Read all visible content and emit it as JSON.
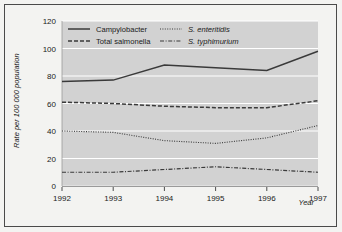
{
  "figure": {
    "background_color": "#f3f3f1",
    "plot_background_color": "#d2d2d2",
    "border_color": "#4a4a4a",
    "gridline_color": "#ffffff",
    "line_color": "#3a3a3a"
  },
  "chart_data": {
    "type": "line",
    "title": "",
    "subtitle": "",
    "xlabel": "Year",
    "ylabel": "Rate per 100 000 population",
    "x": [
      1992,
      1993,
      1994,
      1995,
      1996,
      1997
    ],
    "categories": [
      "1992",
      "1993",
      "1994",
      "1995",
      "1996",
      "1997"
    ],
    "xtick_labels": [
      "1992",
      "1993",
      "1994",
      "1995",
      "1996",
      "1997"
    ],
    "ytick_labels": [
      "0",
      "20",
      "40",
      "60",
      "80",
      "100",
      "120"
    ],
    "yticks": [
      0,
      20,
      40,
      60,
      80,
      100,
      120
    ],
    "xlim": [
      1992,
      1997
    ],
    "ylim": [
      0,
      120
    ],
    "grid": "horizontal",
    "legend_position": "top-inside",
    "series": [
      {
        "name": "Campylobacter",
        "linestyle": "solid",
        "values": [
          76,
          77,
          88,
          86,
          84,
          98
        ]
      },
      {
        "name": "Total salmonella",
        "linestyle": "dashed",
        "values": [
          61,
          60,
          58,
          57,
          57,
          62
        ]
      },
      {
        "name": "S. enteritidis",
        "linestyle": "dotted",
        "italic": true,
        "values": [
          40,
          39,
          33,
          31,
          35,
          44
        ]
      },
      {
        "name": "S. typhimurium",
        "linestyle": "dashdot",
        "italic": true,
        "values": [
          10,
          10,
          12,
          14,
          12,
          10
        ]
      }
    ]
  },
  "legend": {
    "entries": [
      {
        "label": "Campylobacter",
        "style": "solid",
        "italic": false
      },
      {
        "label": "Total salmonella",
        "style": "dashed",
        "italic": false
      },
      {
        "label": "S. enteritidis",
        "style": "dotted",
        "italic": true
      },
      {
        "label": "S. typhimurium",
        "style": "dashdot",
        "italic": true
      }
    ]
  }
}
